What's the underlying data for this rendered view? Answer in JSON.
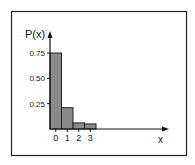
{
  "chart_data": {
    "type": "bar",
    "title": "",
    "xlabel": "x",
    "ylabel": "P(x)",
    "categories": [
      "0",
      "1",
      "2",
      "3"
    ],
    "values": [
      0.75,
      0.21,
      0.06,
      0.05
    ],
    "yticks": [
      "0.25",
      "0.50",
      "0.75"
    ],
    "ytick_values": [
      0.25,
      0.5,
      0.75
    ],
    "ylim": [
      0,
      0.9
    ],
    "grid": false,
    "legend": null
  },
  "colors": {
    "bar": "#8a8a8a",
    "axis": "#111111",
    "frame": "#222222"
  }
}
